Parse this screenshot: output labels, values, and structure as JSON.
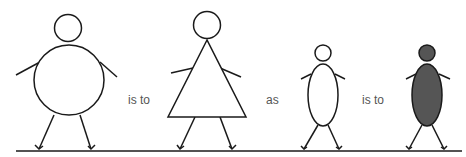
{
  "diagram": {
    "type": "analogy",
    "connectors": [
      "is to",
      "as",
      "is to"
    ],
    "figures": [
      {
        "name": "round-body-figure",
        "body_shape": "circle",
        "fill": "#ffffff"
      },
      {
        "name": "triangle-body-figure",
        "body_shape": "triangle",
        "fill": "#ffffff"
      },
      {
        "name": "small-oval-figure",
        "body_shape": "ellipse",
        "fill": "#ffffff"
      },
      {
        "name": "filled-oval-figure",
        "body_shape": "ellipse",
        "fill": "#555555"
      }
    ],
    "colors": {
      "stroke": "#1a1a1a",
      "text": "#555555",
      "filled_figure": "#555555",
      "background": "#ffffff"
    }
  }
}
